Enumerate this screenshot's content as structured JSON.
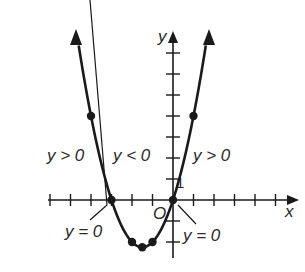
{
  "chart_data": {
    "type": "line",
    "title": "",
    "function": "y = x^2 + 3x",
    "xlabel": "x",
    "ylabel": "y",
    "origin_label": "O",
    "y_tick_label": "1",
    "xlim": [
      -6,
      6
    ],
    "ylim": [
      -3,
      8
    ],
    "grid": false,
    "x_ticks": [
      -6,
      -5,
      -4,
      -3,
      -2,
      -1,
      0,
      1,
      2,
      3,
      4,
      5
    ],
    "y_ticks": [
      -2,
      -1,
      1,
      2,
      3,
      4,
      5,
      6,
      7
    ],
    "marked_points": [
      {
        "x": -4,
        "y": 4
      },
      {
        "x": -3,
        "y": 0
      },
      {
        "x": -2,
        "y": -2
      },
      {
        "x": -1.5,
        "y": -2.25
      },
      {
        "x": -1,
        "y": -2
      },
      {
        "x": 0,
        "y": 0
      },
      {
        "x": 1,
        "y": 4
      }
    ],
    "x_intercepts": [
      -3,
      0
    ],
    "vertex": {
      "x": -1.5,
      "y": -2.25
    },
    "annotations": [
      {
        "text": "y > 0",
        "region": "x < -3"
      },
      {
        "text": "y < 0",
        "region": "-3 < x < 0"
      },
      {
        "text": "y > 0",
        "region": "x > 0"
      },
      {
        "text": "y = 0",
        "at": "x = -3"
      },
      {
        "text": "y = 0",
        "at": "x = 0"
      }
    ]
  },
  "labels": {
    "region_left": "y > 0",
    "region_middle": "y < 0",
    "region_right": "y > 0",
    "zero_left": "y = 0",
    "zero_right": "y = 0",
    "x_axis": "x",
    "y_axis": "y",
    "origin": "O",
    "one": "1"
  }
}
